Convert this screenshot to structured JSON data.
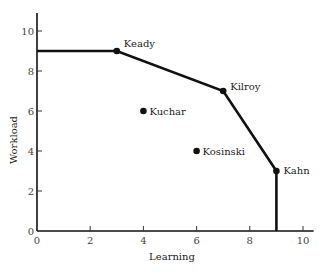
{
  "chart_data": {
    "type": "scatter",
    "title": "",
    "xlabel": "Learning",
    "ylabel": "Workload",
    "xlim": [
      0,
      10.4
    ],
    "ylim": [
      0,
      10.9
    ],
    "xticks": [
      0,
      2,
      4,
      6,
      8,
      10
    ],
    "yticks": [
      0,
      2,
      4,
      6,
      8,
      10
    ],
    "grid": false,
    "legend": null,
    "points": [
      {
        "name": "Keady",
        "x": 3,
        "y": 9
      },
      {
        "name": "Kilroy",
        "x": 7,
        "y": 7
      },
      {
        "name": "Kuchar",
        "x": 4,
        "y": 6
      },
      {
        "name": "Kosinski",
        "x": 6,
        "y": 4
      },
      {
        "name": "Kahn",
        "x": 9,
        "y": 3
      }
    ],
    "frontier": {
      "name": "efficient frontier",
      "path": [
        [
          0,
          9
        ],
        [
          3,
          9
        ],
        [
          7,
          7
        ],
        [
          9,
          3
        ],
        [
          9,
          0
        ]
      ]
    }
  }
}
